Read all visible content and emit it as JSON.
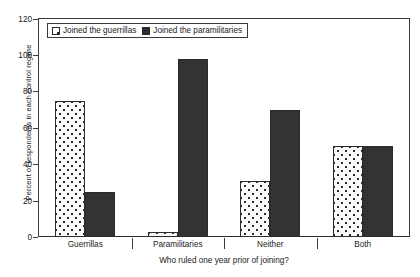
{
  "chart_data": {
    "type": "bar",
    "title": "",
    "subtitle": "",
    "categories": [
      "Guerrillas",
      "Paramilitaries",
      "Neither",
      "Both"
    ],
    "series": [
      {
        "name": "Joined the guerrillas",
        "values": [
          75,
          3,
          31,
          50
        ],
        "pattern": "dotted",
        "color": "#fbfbfb"
      },
      {
        "name": "Joined the paramilitaries",
        "values": [
          25,
          98,
          70,
          50
        ],
        "pattern": "solid",
        "color": "#333333"
      }
    ],
    "xlabel": "Who ruled one year prior of joining?",
    "ylabel": "Percent of respondents in each control regime",
    "ylim": [
      0,
      120
    ],
    "yticks": [
      0,
      20,
      40,
      60,
      80,
      100,
      120
    ],
    "ytick_labels": [
      "0",
      "20",
      "40",
      "60",
      "80",
      "100",
      "120"
    ],
    "grid": false,
    "legend_position": "top-left",
    "frame": true
  },
  "legend": {
    "items": [
      {
        "label": "Joined the guerrillas",
        "swatch": "dotted-square-icon"
      },
      {
        "label": "Joined the paramilitaries",
        "swatch": "solid-square-icon"
      }
    ]
  }
}
